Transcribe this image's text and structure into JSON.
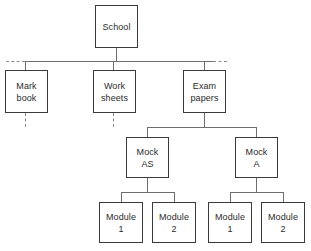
{
  "diagram": {
    "type": "tree",
    "colors": {
      "box_border": "#3a3a3a",
      "connector": "#6e6e6e",
      "dashed_connector": "#8a8a8a",
      "text": "#2b2b2b",
      "background": "#ffffff"
    },
    "nodes": {
      "school": {
        "label": "School",
        "line1": "School",
        "line2": ""
      },
      "mark_book": {
        "label": "Mark book",
        "line1": "Mark",
        "line2": "book"
      },
      "work_sheets": {
        "label": "Work sheets",
        "line1": "Work",
        "line2": "sheets"
      },
      "exam_papers": {
        "label": "Exam papers",
        "line1": "Exam",
        "line2": "papers"
      },
      "mock_as": {
        "label": "Mock AS",
        "line1": "Mock",
        "line2": "AS"
      },
      "mock_a": {
        "label": "Mock A",
        "line1": "Mock",
        "line2": "A"
      },
      "mock_as_module_1": {
        "label": "Module 1",
        "line1": "Module",
        "line2": "1"
      },
      "mock_as_module_2": {
        "label": "Module 2",
        "line1": "Module",
        "line2": "2"
      },
      "mock_a_module_1": {
        "label": "Module 1",
        "line1": "Module",
        "line2": "1"
      },
      "mock_a_module_2": {
        "label": "Module 2",
        "line1": "Module",
        "line2": "2"
      }
    },
    "levels": [
      {
        "level": 1,
        "nodes": [
          "School"
        ]
      },
      {
        "level": 2,
        "nodes": [
          "Mark book",
          "Work sheets",
          "Exam papers"
        ]
      },
      {
        "level": 3,
        "nodes": [
          "Mock AS",
          "Mock A"
        ]
      },
      {
        "level": 4,
        "nodes": [
          "Module 1",
          "Module 2",
          "Module 1",
          "Module 2"
        ]
      }
    ],
    "edges": [
      {
        "from": "School",
        "to": "Mark book",
        "style": "solid"
      },
      {
        "from": "School",
        "to": "Work sheets",
        "style": "solid"
      },
      {
        "from": "School",
        "to": "Exam papers",
        "style": "solid"
      },
      {
        "from": "Mark book",
        "to": "",
        "style": "dashed"
      },
      {
        "from": "Work sheets",
        "to": "",
        "style": "dashed"
      },
      {
        "from": "Exam papers",
        "to": "Mock AS",
        "style": "solid"
      },
      {
        "from": "Exam papers",
        "to": "Mock A",
        "style": "solid"
      },
      {
        "from": "Mock AS",
        "to": "Module 1",
        "style": "solid"
      },
      {
        "from": "Mock AS",
        "to": "Module 2",
        "style": "solid"
      },
      {
        "from": "Mock A",
        "to": "Module 1",
        "style": "solid"
      },
      {
        "from": "Mock A",
        "to": "Module 2",
        "style": "solid"
      }
    ]
  }
}
